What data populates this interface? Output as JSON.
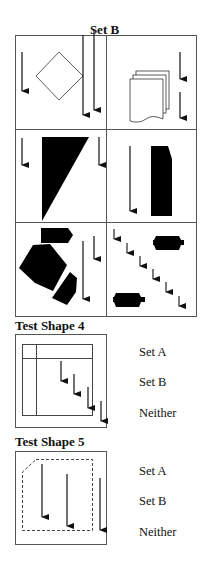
{
  "set_b": {
    "title": "Set B",
    "cells": [
      {
        "id": "r1c1",
        "content": "diamond outline with three down arrows"
      },
      {
        "id": "r1c2",
        "content": "stacked documents icon with two down arrows"
      },
      {
        "id": "r2c1",
        "content": "black right triangle with two down arrows"
      },
      {
        "id": "r2c2",
        "content": "black tall rectangle with clipped corner and one down arrow"
      },
      {
        "id": "r3c1",
        "content": "black pentagon, two arrow-shaped blocks, two down arrows"
      },
      {
        "id": "r3c2",
        "content": "two black notched rectangles with six diagonal small down arrows"
      }
    ]
  },
  "test_shape_4": {
    "title": "Test Shape 4",
    "options": [
      "Set A",
      "Set B",
      "Neither"
    ]
  },
  "test_shape_5": {
    "title": "Test Shape 5",
    "options": [
      "Set A",
      "Set B",
      "Neither"
    ]
  }
}
